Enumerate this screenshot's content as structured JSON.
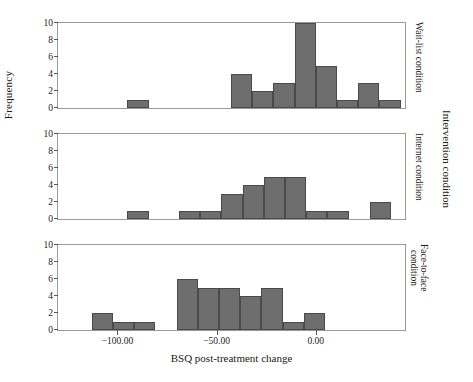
{
  "chart_data": {
    "type": "bar",
    "title": "",
    "xlabel": "BSQ post-treatment change",
    "ylabel": "Frequency",
    "outer_right_label": "Intervention condition",
    "xlim": [
      -130,
      45
    ],
    "ylim": [
      0,
      10
    ],
    "xticks": [
      -100,
      -50,
      0
    ],
    "xticklabels": [
      "−100.00",
      "−50.00",
      "0.00"
    ],
    "yticks": [
      0,
      2,
      4,
      6,
      8,
      10
    ],
    "yticklabels": [
      "0",
      "2",
      "4",
      "6",
      "8",
      "10"
    ],
    "grid": false,
    "legend": "none",
    "bin_width": 10.7,
    "bar_color": "#6e6e6e",
    "panels": [
      {
        "label": "Wait-list condition",
        "bins": [
          {
            "x_left": -95.0,
            "count": 1
          },
          {
            "x_left": -42.8,
            "count": 4
          },
          {
            "x_left": -32.1,
            "count": 2
          },
          {
            "x_left": -21.4,
            "count": 3
          },
          {
            "x_left": -10.7,
            "count": 10
          },
          {
            "x_left": 0.0,
            "count": 5
          },
          {
            "x_left": 10.7,
            "count": 1
          },
          {
            "x_left": 21.4,
            "count": 3
          },
          {
            "x_left": 32.1,
            "count": 1
          }
        ]
      },
      {
        "label": "Internet condition",
        "bins": [
          {
            "x_left": -95.0,
            "count": 1
          },
          {
            "x_left": -69.0,
            "count": 1
          },
          {
            "x_left": -58.3,
            "count": 1
          },
          {
            "x_left": -47.6,
            "count": 3
          },
          {
            "x_left": -36.9,
            "count": 4
          },
          {
            "x_left": -26.2,
            "count": 5
          },
          {
            "x_left": -15.5,
            "count": 5
          },
          {
            "x_left": -4.8,
            "count": 1
          },
          {
            "x_left": 5.9,
            "count": 1
          },
          {
            "x_left": 27.3,
            "count": 2
          }
        ]
      },
      {
        "label": "Face-to-face\ncondition",
        "bins": [
          {
            "x_left": -113.0,
            "count": 2
          },
          {
            "x_left": -102.3,
            "count": 1
          },
          {
            "x_left": -91.6,
            "count": 1
          },
          {
            "x_left": -70.2,
            "count": 6
          },
          {
            "x_left": -59.5,
            "count": 5
          },
          {
            "x_left": -48.8,
            "count": 5
          },
          {
            "x_left": -38.1,
            "count": 4
          },
          {
            "x_left": -27.4,
            "count": 5
          },
          {
            "x_left": -16.7,
            "count": 1
          },
          {
            "x_left": -6.0,
            "count": 2
          }
        ]
      }
    ]
  }
}
